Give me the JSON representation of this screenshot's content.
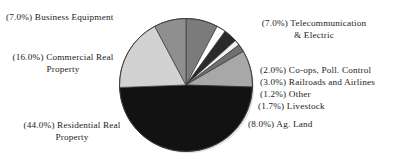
{
  "chart_data": {
    "type": "pie",
    "title": "",
    "xlabel": "",
    "ylabel": "",
    "legend_position": "callout-labels",
    "grid": false,
    "units": "percent",
    "categories": [
      "Telecommunication & Electric",
      "Co-ops, Poll. Control",
      "Railroads and Airlines",
      "Other",
      "Livestock",
      "Ag. Land",
      "Residential Real Property",
      "Commercial Real Property",
      "Business Equipment"
    ],
    "values": [
      7.0,
      2.0,
      3.0,
      1.2,
      1.7,
      8.0,
      44.0,
      16.0,
      7.0
    ],
    "slices": [
      {
        "label": "Telecommunication & Electric",
        "value": 7.0,
        "percent_text": "(7.0%)",
        "color": "#7b7b7b"
      },
      {
        "label": "Co-ops, Poll. Control",
        "value": 2.0,
        "percent_text": "(2.0%)",
        "color": "#ffffff"
      },
      {
        "label": "Railroads and Airlines",
        "value": 3.0,
        "percent_text": "(3.0%)",
        "color": "#2a2a2a"
      },
      {
        "label": "Other",
        "value": 1.2,
        "percent_text": "(1.2%)",
        "color": "#f2f2f2"
      },
      {
        "label": "Livestock",
        "value": 1.7,
        "percent_text": "(1.7%)",
        "color": "#6f6f6f"
      },
      {
        "label": "Ag. Land",
        "value": 8.0,
        "percent_text": "(8.0%)",
        "color": "#a8a8a8"
      },
      {
        "label": "Residential Real Property",
        "value": 44.0,
        "percent_text": "(44.0%)",
        "color": "#121212"
      },
      {
        "label": "Commercial Real Property",
        "value": 16.0,
        "percent_text": "(16.0%)",
        "color": "#d2d2d2"
      },
      {
        "label": "Business Equipment",
        "value": 7.0,
        "percent_text": "(7.0%)",
        "color": "#8f8f8f"
      }
    ]
  },
  "labels": {
    "business_equipment": "(7.0%) Business Equipment",
    "commercial_real_property": "(16.0%) Commercial Real\nProperty",
    "residential_real_property": "(44.0%) Residential Real\nProperty",
    "telecommunication_electric": "(7.0%) Telecommunication\n& Electric",
    "coops_poll_control": "(2.0%) Co-ops, Poll. Control",
    "railroads_and_airlines": "(3.0%) Railroads and Airlines",
    "other": "(1.2%) Other",
    "livestock": "(1.7%) Livestock",
    "ag_land": "(8.0%) Ag. Land"
  }
}
